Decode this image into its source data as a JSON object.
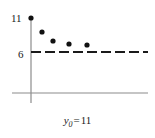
{
  "figure": {
    "name": "asymptotic-convergence-plot",
    "background_color": "#ffffff",
    "width": 155,
    "height": 138
  },
  "axes": {
    "x_axis": {
      "name": "x-axis",
      "y_pixel": 93,
      "x_start_pixel": 12,
      "x_end_pixel": 148,
      "color": "#8c8c8c",
      "stroke_width": 1.2
    },
    "y_axis": {
      "name": "y-axis",
      "x_pixel": 31,
      "y_start_pixel": 17,
      "y_end_pixel": 103,
      "color": "#8c8c8c",
      "stroke_width": 1.2
    },
    "tick_labels": [
      {
        "text": "11",
        "axis": "y",
        "value": 11,
        "y_pixel": 18
      },
      {
        "text": "6",
        "axis": "y",
        "value": 6,
        "y_pixel": 54
      }
    ]
  },
  "asymptote": {
    "name": "asymptote-dashed-line",
    "label": "6",
    "value": 6,
    "y_pixel": 52,
    "x_start_pixel": 31,
    "x_end_pixel": 148,
    "color": "#1a1a1a",
    "stroke_width": 2.2,
    "dash_pattern": "10 4"
  },
  "caption": {
    "variable": "y",
    "subscript": "0",
    "equals": "=",
    "value": "11",
    "full_text": "y0 = 11"
  },
  "chart_data": {
    "type": "scatter",
    "title": "",
    "subtitle": "",
    "xlabel": "",
    "ylabel": "",
    "annotations": [
      "y0 = 11"
    ],
    "legend": [],
    "legend_position": "none",
    "grid": false,
    "xlim": [
      0,
      10
    ],
    "ylim": [
      0,
      12
    ],
    "yticks": [
      6,
      11
    ],
    "ytick_labels": [
      "6",
      "11"
    ],
    "xticks": [],
    "xtick_labels": [],
    "asymptote_y": 6,
    "series": [
      {
        "name": "iterates",
        "marker": "filled-circle",
        "color": "#111111",
        "marker_radius_px": 2.6,
        "x": [
          0,
          1,
          2,
          3,
          4
        ],
        "y": [
          11,
          8.8,
          7.4,
          6.8,
          6.5
        ],
        "points_px": [
          {
            "x": 31,
            "y": 18
          },
          {
            "x": 42,
            "y": 32
          },
          {
            "x": 53,
            "y": 41
          },
          {
            "x": 69,
            "y": 44
          },
          {
            "x": 87,
            "y": 45
          }
        ]
      }
    ]
  }
}
